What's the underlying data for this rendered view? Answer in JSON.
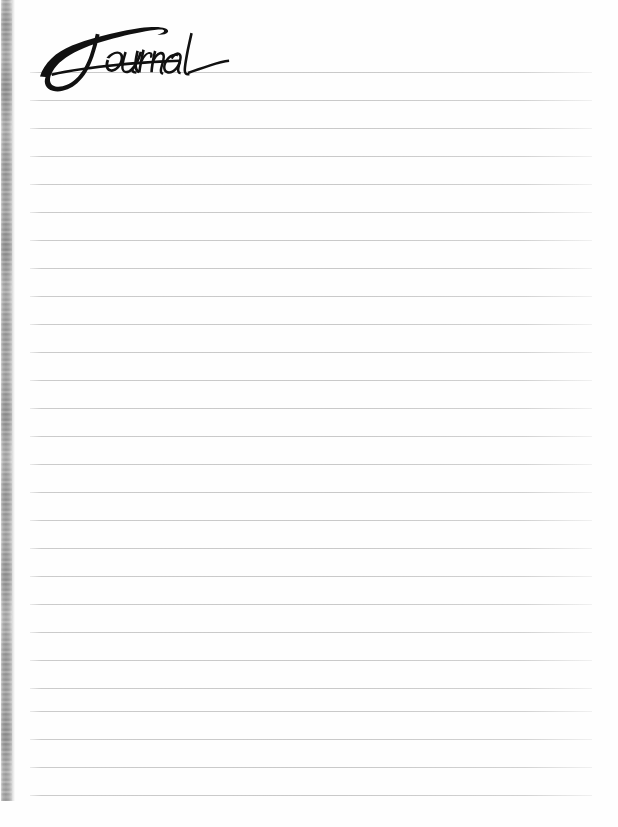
{
  "page": {
    "width": 618,
    "height": 827,
    "background_color": "#fefefe",
    "type": "lined-journal-page"
  },
  "title": {
    "text": "Journal",
    "style": "handwritten-script",
    "color": "#111111",
    "left": 38,
    "top": 25,
    "width": 157,
    "height": 53
  },
  "spine": {
    "label": "paper-edge-texture",
    "left": 1,
    "top": 0,
    "width": 11,
    "height": 801,
    "color_light": "#d9d9d9",
    "color_dark": "#a9a9a9"
  },
  "rules": {
    "label": "ruled-writing-lines",
    "count": 27,
    "first_y": 72,
    "spacing": 28,
    "left": 30,
    "right": 592,
    "thickness": 1,
    "color": "#c9c9c9",
    "y_positions": [
      72,
      100,
      128,
      156,
      184,
      212,
      240,
      268,
      296,
      324,
      352,
      380,
      408,
      436,
      464,
      492,
      520,
      548,
      576,
      604,
      632,
      660,
      688,
      711,
      739,
      767,
      795
    ]
  }
}
